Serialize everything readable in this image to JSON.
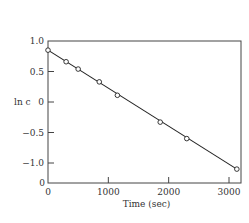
{
  "chart_data": {
    "type": "line",
    "title": "",
    "xlabel": "Time (sec)",
    "ylabel": "ln c",
    "xlim": [
      0,
      3200
    ],
    "ylim": [
      -1.3,
      1.0
    ],
    "x_ticks": [
      0,
      1000,
      2000,
      3000
    ],
    "x_tick_labels": [
      "0",
      "1000",
      "2000",
      "3000"
    ],
    "y_ticks": [
      1.0,
      0.5,
      0,
      -0.5,
      -1.0
    ],
    "y_tick_labels": [
      "1.0",
      "0.5",
      "0",
      "−0.5",
      "−1.0"
    ],
    "origin_label": "0",
    "grid": false,
    "legend": null,
    "series": [
      {
        "name": "ln c",
        "marker": "open-circle",
        "x": [
          0,
          300,
          500,
          850,
          1150,
          1860,
          2300,
          3130
        ],
        "y": [
          0.85,
          0.66,
          0.54,
          0.33,
          0.11,
          -0.33,
          -0.6,
          -1.1
        ]
      }
    ]
  }
}
